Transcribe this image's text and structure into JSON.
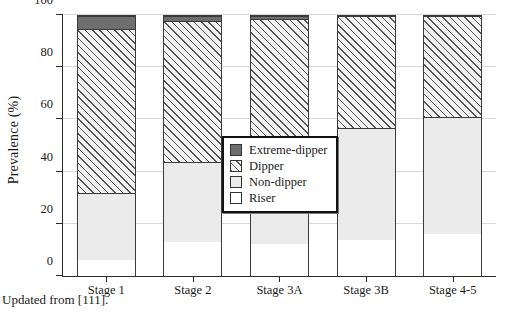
{
  "caption": "Updated from [111].",
  "chart_data": {
    "type": "bar",
    "subtype": "stacked-100-percent",
    "title": "",
    "xlabel": "",
    "ylabel": "Prevalence (%)",
    "ylim": [
      0,
      100
    ],
    "yticks": [
      0,
      20,
      40,
      60,
      80,
      100
    ],
    "ytick_labels": [
      "0",
      "20",
      "40",
      "60",
      "80",
      "100"
    ],
    "grid": true,
    "legend_position": "center",
    "categories": [
      "Stage 1",
      "Stage 2",
      "Stage 3A",
      "Stage 3B",
      "Stage 4-5"
    ],
    "series": [
      {
        "name": "Riser",
        "color": "#ffffff",
        "pattern": "solid",
        "values": [
          6,
          13,
          12.5,
          14,
          16
        ]
      },
      {
        "name": "Non-dipper",
        "color": "#ebebeb",
        "pattern": "solid",
        "values": [
          26,
          31,
          35.5,
          43,
          45
        ]
      },
      {
        "name": "Dipper",
        "color": "#f2f2f2",
        "pattern": "diagonal-hatch",
        "values": [
          63,
          54,
          51,
          43,
          39
        ]
      },
      {
        "name": "Extreme-dipper",
        "color": "#6e6e6e",
        "pattern": "solid",
        "values": [
          5,
          2,
          1,
          0,
          0
        ]
      }
    ],
    "stack_order_bottom_to_top": [
      "Riser",
      "Non-dipper",
      "Dipper",
      "Extreme-dipper"
    ],
    "legend_entries_top_to_bottom": [
      "Extreme-dipper",
      "Dipper",
      "Non-dipper",
      "Riser"
    ]
  }
}
